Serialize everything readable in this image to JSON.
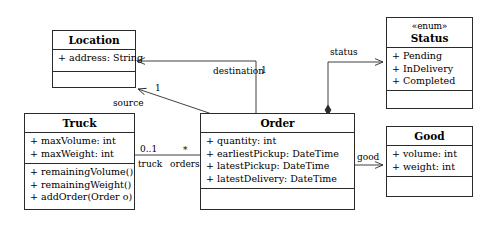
{
  "diagram": {
    "stroke_color": "#2b2b2b",
    "background": "#ffffff"
  },
  "classes": {
    "location": {
      "name": "Location",
      "attributes": [
        "+ address: String"
      ],
      "operations": []
    },
    "truck": {
      "name": "Truck",
      "attributes": [
        "+ maxVolume: int",
        "+ maxWeight: int"
      ],
      "operations": [
        "+ remainingVolume()",
        "+ remainingWeight()",
        "+ addOrder(Order o)"
      ]
    },
    "order": {
      "name": "Order",
      "attributes": [
        "+ quantity: int",
        "+ earliestPickup: DateTime",
        "+ latestPickup: DateTime",
        "+ latestDelivery: DateTime"
      ],
      "operations": []
    },
    "status": {
      "stereotype": "«enum»",
      "name": "Status",
      "attributes": [
        "+ Pending",
        "+ InDelivery",
        "+ Completed"
      ],
      "operations": []
    },
    "good": {
      "name": "Good",
      "attributes": [
        "+ volume: int",
        "+ weight: int"
      ],
      "operations": []
    }
  },
  "associations": {
    "destination": {
      "role": "destination",
      "multiplicity": "1"
    },
    "source": {
      "role": "source",
      "multiplicity": "1"
    },
    "truck_orders": {
      "truck_multiplicity": "0..1",
      "orders_multiplicity": "*",
      "truck_role": "truck",
      "orders_role": "orders"
    },
    "status_link": {
      "role": "status"
    },
    "good_link": {
      "role": "good"
    }
  }
}
